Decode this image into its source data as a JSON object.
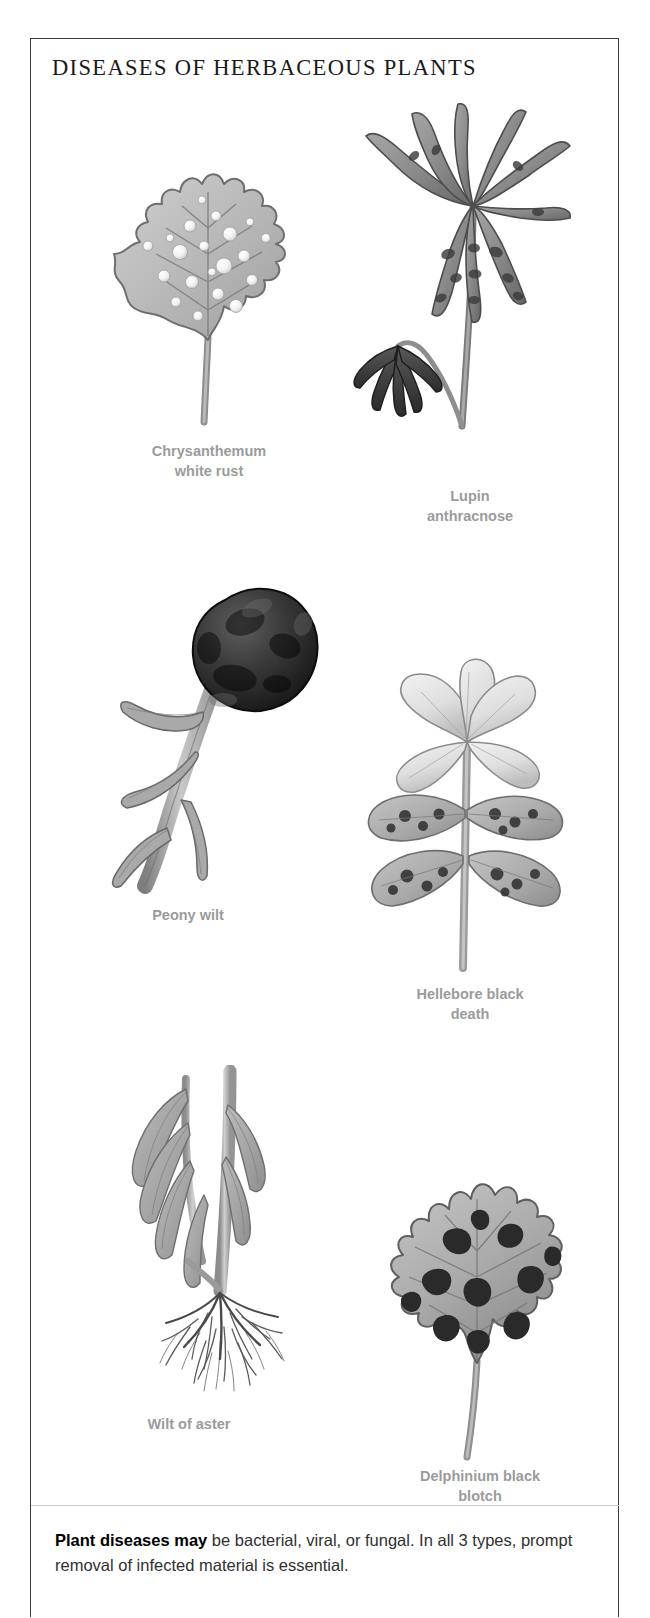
{
  "page": {
    "title": "DISEASES OF HERBACEOUS PLANTS",
    "border_color": "#3a3a3a",
    "background": "#ffffff",
    "caption_color": "#9b9b9b"
  },
  "figures": [
    {
      "id": "chrysanthemum-white-rust",
      "caption": "Chrysanthemum\nwhite rust",
      "subject": "serrated chrysanthemum leaf covered with raised white rust pustules"
    },
    {
      "id": "lupin-anthracnose",
      "caption": "Lupin\nanthracnose",
      "subject": "palmate lupin leaf with twisted blighted leaflets and a collapsed wilted shoot"
    },
    {
      "id": "peony-wilt",
      "caption": "Peony wilt",
      "subject": "peony flower bud blackened and rotted on a drooping stem with wilted leaves"
    },
    {
      "id": "hellebore-black-death",
      "caption": "Hellebore black\ndeath",
      "subject": "hellebore flower and leaves mottled with dark necrotic blotches"
    },
    {
      "id": "wilt-of-aster",
      "caption": "Wilt of aster",
      "subject": "aster stem with collapsed wilting foliage and exposed fibrous root system"
    },
    {
      "id": "delphinium-black-blotch",
      "caption": "Delphinium black\nblotch",
      "subject": "deeply lobed delphinium leaf bearing irregular black blotches"
    }
  ],
  "footer": {
    "lead_in": "Plant diseases may",
    "body": " be bacterial, viral, or fungal. In all 3 types, prompt removal of infected material is essential."
  }
}
